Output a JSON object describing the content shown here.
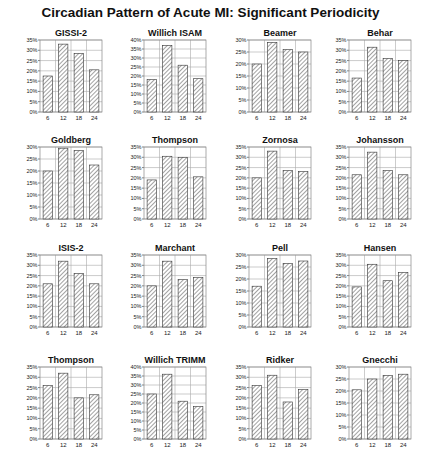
{
  "title": "Circadian Pattern of Acute MI: Significant Periodicity",
  "footer": "",
  "chart_data": [
    {
      "type": "bar",
      "title": "GISSI-2",
      "categories": [
        "6",
        "12",
        "18",
        "24"
      ],
      "values": [
        17.5,
        33,
        28.5,
        20.5
      ],
      "ylim": [
        0,
        35
      ],
      "yticks": [
        "0%",
        "5%",
        "10%",
        "15%",
        "20%",
        "25%",
        "30%",
        "35%"
      ],
      "grid": true
    },
    {
      "type": "bar",
      "title": "Willich ISAM",
      "categories": [
        "6",
        "12",
        "18",
        "24"
      ],
      "values": [
        18,
        37,
        26,
        18.5
      ],
      "ylim": [
        0,
        40
      ],
      "yticks": [
        "0%",
        "5%",
        "10%",
        "15%",
        "20%",
        "25%",
        "30%",
        "35%",
        "40%"
      ],
      "grid": true
    },
    {
      "type": "bar",
      "title": "Beamer",
      "categories": [
        "6",
        "12",
        "18",
        "24"
      ],
      "values": [
        20,
        29,
        26,
        25
      ],
      "ylim": [
        0,
        30
      ],
      "yticks": [
        "0%",
        "5%",
        "10%",
        "15%",
        "20%",
        "25%",
        "30%"
      ],
      "grid": true
    },
    {
      "type": "bar",
      "title": "Behar",
      "categories": [
        "6",
        "12",
        "18",
        "24"
      ],
      "values": [
        16.5,
        31.5,
        26,
        25
      ],
      "ylim": [
        0,
        35
      ],
      "yticks": [
        "0%",
        "5%",
        "10%",
        "15%",
        "20%",
        "25%",
        "30%",
        "35%"
      ],
      "grid": true
    },
    {
      "type": "bar",
      "title": "Goldberg",
      "categories": [
        "6",
        "12",
        "18",
        "24"
      ],
      "values": [
        20,
        29.5,
        28.5,
        22.5
      ],
      "ylim": [
        0,
        30
      ],
      "yticks": [
        "0%",
        "5%",
        "10%",
        "15%",
        "20%",
        "25%",
        "30%"
      ],
      "grid": true
    },
    {
      "type": "bar",
      "title": "Thompson",
      "categories": [
        "6",
        "12",
        "18",
        "24"
      ],
      "values": [
        19,
        30.5,
        30,
        20.5
      ],
      "ylim": [
        0,
        35
      ],
      "yticks": [
        "0%",
        "5%",
        "10%",
        "15%",
        "20%",
        "25%",
        "30%",
        "35%"
      ],
      "grid": true
    },
    {
      "type": "bar",
      "title": "Zornosa",
      "categories": [
        "6",
        "12",
        "18",
        "24"
      ],
      "values": [
        20,
        33,
        23.5,
        23
      ],
      "ylim": [
        0,
        35
      ],
      "yticks": [
        "0%",
        "5%",
        "10%",
        "15%",
        "20%",
        "25%",
        "30%",
        "35%"
      ],
      "grid": true
    },
    {
      "type": "bar",
      "title": "Johansson",
      "categories": [
        "6",
        "12",
        "18",
        "24"
      ],
      "values": [
        21.5,
        32.5,
        23.5,
        21.5
      ],
      "ylim": [
        0,
        35
      ],
      "yticks": [
        "0%",
        "5%",
        "10%",
        "15%",
        "20%",
        "25%",
        "30%",
        "35%"
      ],
      "grid": true
    },
    {
      "type": "bar",
      "title": "ISIS-2",
      "categories": [
        "6",
        "12",
        "18",
        "24"
      ],
      "values": [
        21,
        32,
        26,
        21
      ],
      "ylim": [
        0,
        35
      ],
      "yticks": [
        "0%",
        "5%",
        "10%",
        "15%",
        "20%",
        "25%",
        "30%",
        "35%"
      ],
      "grid": true
    },
    {
      "type": "bar",
      "title": "Marchant",
      "categories": [
        "6",
        "12",
        "18",
        "24"
      ],
      "values": [
        20,
        32,
        23,
        24
      ],
      "ylim": [
        0,
        35
      ],
      "yticks": [
        "0%",
        "5%",
        "10%",
        "15%",
        "20%",
        "25%",
        "30%",
        "35%"
      ],
      "grid": true
    },
    {
      "type": "bar",
      "title": "Pell",
      "categories": [
        "6",
        "12",
        "18",
        "24"
      ],
      "values": [
        17,
        28.5,
        26.5,
        27.5
      ],
      "ylim": [
        0,
        30
      ],
      "yticks": [
        "0%",
        "5%",
        "10%",
        "15%",
        "20%",
        "25%",
        "30%"
      ],
      "grid": true
    },
    {
      "type": "bar",
      "title": "Hansen",
      "categories": [
        "6",
        "12",
        "18",
        "24"
      ],
      "values": [
        19.5,
        30.5,
        22.5,
        26.5
      ],
      "ylim": [
        0,
        35
      ],
      "yticks": [
        "0%",
        "5%",
        "10%",
        "15%",
        "20%",
        "25%",
        "30%",
        "35%"
      ],
      "grid": true
    },
    {
      "type": "bar",
      "title": "Thompson",
      "categories": [
        "6",
        "12",
        "18",
        "24"
      ],
      "values": [
        26,
        32,
        20,
        21.5
      ],
      "ylim": [
        0,
        35
      ],
      "yticks": [
        "0%",
        "5%",
        "10%",
        "15%",
        "20%",
        "25%",
        "30%",
        "35%"
      ],
      "grid": true
    },
    {
      "type": "bar",
      "title": "Willich TRIMM",
      "categories": [
        "6",
        "12",
        "18",
        "24"
      ],
      "values": [
        25,
        36,
        21,
        18
      ],
      "ylim": [
        0,
        40
      ],
      "yticks": [
        "0%",
        "5%",
        "10%",
        "15%",
        "20%",
        "25%",
        "30%",
        "35%",
        "40%"
      ],
      "grid": true
    },
    {
      "type": "bar",
      "title": "Ridker",
      "categories": [
        "6",
        "12",
        "18",
        "24"
      ],
      "values": [
        26,
        31,
        18,
        24
      ],
      "ylim": [
        0,
        35
      ],
      "yticks": [
        "0%",
        "5%",
        "10%",
        "15%",
        "20%",
        "25%",
        "30%",
        "35%"
      ],
      "grid": true
    },
    {
      "type": "bar",
      "title": "Gnecchi",
      "categories": [
        "6",
        "12",
        "18",
        "24"
      ],
      "values": [
        20.5,
        25,
        26.5,
        27
      ],
      "ylim": [
        0,
        30
      ],
      "yticks": [
        "0%",
        "5%",
        "10%",
        "15%",
        "20%",
        "25%",
        "30%"
      ],
      "grid": true
    }
  ]
}
